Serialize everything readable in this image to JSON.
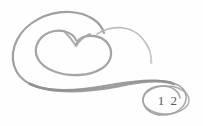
{
  "image": {
    "kind": "scanned-page-ornament",
    "description": "Decorative grayscale spiral flourish with heart motif and page number in an ellipse",
    "width": 203,
    "height": 126,
    "background_color": "#fefefe"
  },
  "ornament": {
    "name": "spiral-heart-flourish",
    "stroke_color": "#8d8d90",
    "stroke_color_light": "#b6b6b9",
    "stroke_color_faint": "#cfcfd2",
    "parts": [
      {
        "name": "outer-spiral-arc",
        "stroke_width": 2.1
      },
      {
        "name": "heart-loop",
        "stroke_width": 2.3
      },
      {
        "name": "tapering-tail",
        "stroke_width": 1.4
      },
      {
        "name": "lower-sweep",
        "stroke_width": 2.4
      },
      {
        "name": "page-number-ellipse",
        "stroke_width": 1.5
      }
    ]
  },
  "page_number": {
    "label": "1 2",
    "value": 12,
    "text_color": "#58585a"
  }
}
